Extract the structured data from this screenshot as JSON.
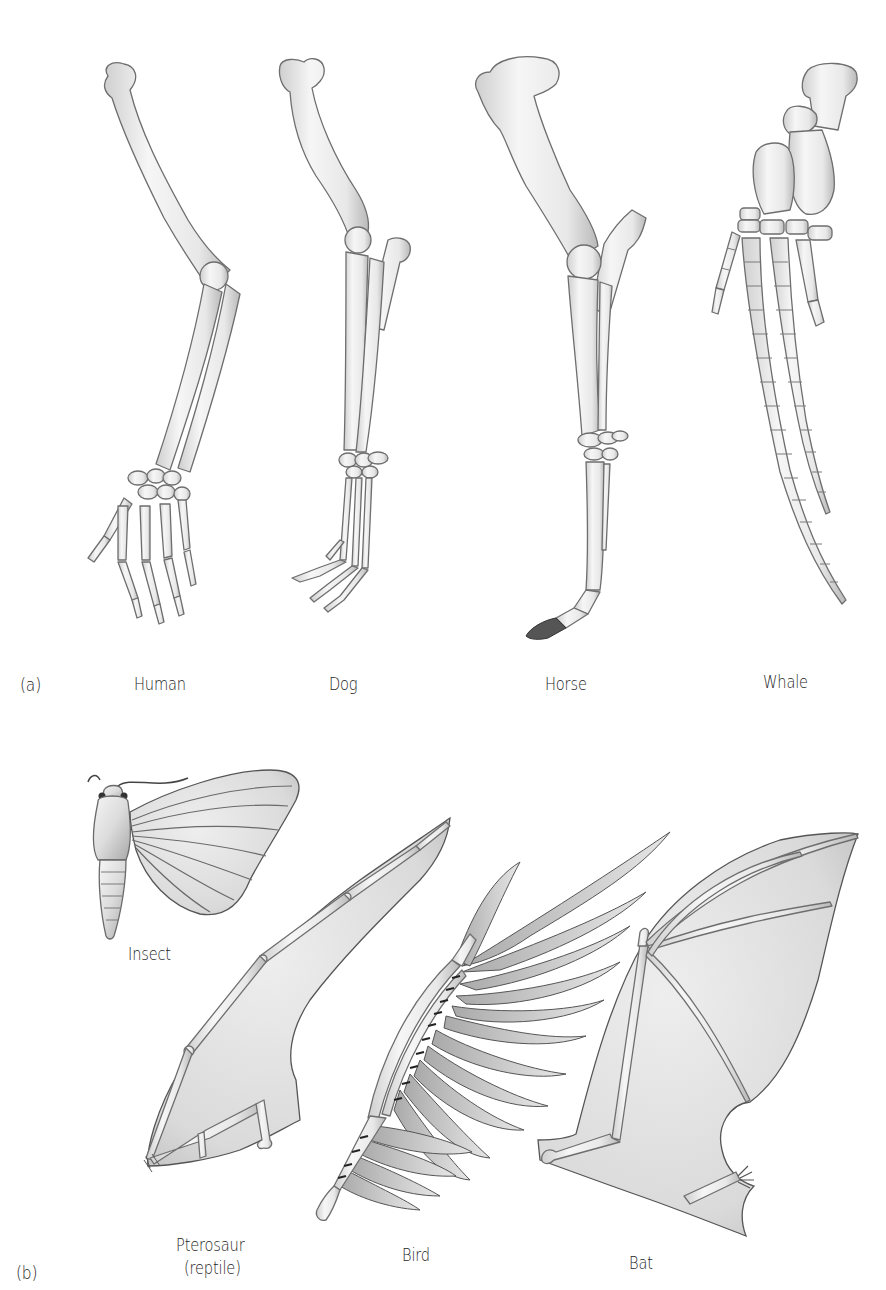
{
  "figure": {
    "panel_a": {
      "letter": "(a)",
      "title": "Homologous forelimbs",
      "labels": [
        {
          "id": "human",
          "text": "Human"
        },
        {
          "id": "dog",
          "text": "Dog"
        },
        {
          "id": "horse",
          "text": "Horse"
        },
        {
          "id": "whale",
          "text": "Whale"
        }
      ]
    },
    "panel_b": {
      "letter": "(b)",
      "labels": [
        {
          "id": "insect",
          "text": "Insect"
        },
        {
          "id": "pterosaur",
          "text": "Pterosaur",
          "subtext": "(reptile)"
        },
        {
          "id": "bird",
          "text": "Bird"
        },
        {
          "id": "bat",
          "text": "Bat"
        }
      ]
    },
    "colors": {
      "background": "#ffffff",
      "bone_light": "#f4f4f4",
      "bone_shade": "#bdbdbd",
      "outline": "#6e6e6e",
      "membrane": "#d9d9d9",
      "hoof": "#555555",
      "text": "#1d1d1d"
    }
  }
}
